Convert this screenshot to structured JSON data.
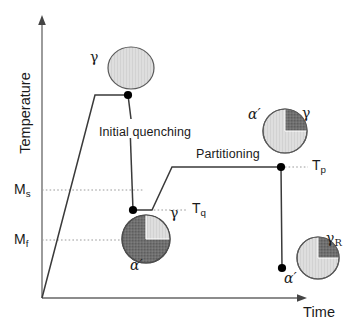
{
  "figure": {
    "type": "process-schematic"
  },
  "axes": {
    "y_label": "Temperature",
    "x_label": "Time",
    "y_arrow": "up-arrow-head",
    "x_arrow": "right-arrow-head",
    "origin": {
      "x": 42,
      "y": 298
    },
    "y_top": {
      "x": 42,
      "y": 18
    },
    "x_right": {
      "x": 306,
      "y": 298
    }
  },
  "temperature_markers": [
    {
      "id": "ms",
      "label_main": "M",
      "label_sub": "s",
      "y": 190,
      "dash_x_end": 143
    },
    {
      "id": "mf",
      "label_main": "M",
      "label_sub": "f",
      "y": 240,
      "dash_x_end": 122
    },
    {
      "id": "tq",
      "label_main": "T",
      "label_sub": "q",
      "y": 210,
      "dash_x_start": 152,
      "dash_x_end": 186
    },
    {
      "id": "tp",
      "label_main": "T",
      "label_sub": "p",
      "y": 167,
      "dash_x_start": 281,
      "dash_x_end": 306
    }
  ],
  "process_labels": [
    {
      "id": "initial-quenching",
      "text": "Initial quenching",
      "x": 100,
      "y": 127
    },
    {
      "id": "partitioning",
      "text": "Partitioning",
      "x": 196,
      "y": 149
    }
  ],
  "path_points": [
    {
      "x": 42,
      "y": 298
    },
    {
      "x": 95,
      "y": 95
    },
    {
      "x": 128,
      "y": 95
    },
    {
      "x": 133,
      "y": 210
    },
    {
      "x": 152,
      "y": 210
    },
    {
      "x": 172,
      "y": 167
    },
    {
      "x": 281,
      "y": 167
    },
    {
      "x": 282,
      "y": 268
    }
  ],
  "markers": [
    {
      "id": "austenitizing-end",
      "x": 128,
      "y": 95
    },
    {
      "id": "quench-stop",
      "x": 133,
      "y": 210
    },
    {
      "id": "partitioning-end",
      "x": 281,
      "y": 167
    },
    {
      "id": "final-quench-end",
      "x": 282,
      "y": 268
    }
  ],
  "microstructures": [
    {
      "id": "austenite",
      "cx": 131,
      "cy": 68,
      "rx": 23,
      "ry": 21,
      "base_fill": "light",
      "wedge": null,
      "labels": [
        {
          "id": "gamma",
          "text": "γ",
          "sub": "",
          "x": 92,
          "y": 52
        }
      ]
    },
    {
      "id": "as-quenched",
      "cx": 146,
      "cy": 239,
      "rx": 24,
      "ry": 24,
      "base_fill": "dark",
      "wedge": {
        "quadrant": "upper-right",
        "fill": "light"
      },
      "labels": [
        {
          "id": "gamma",
          "text": "γ",
          "sub": "",
          "x": 171,
          "y": 213
        },
        {
          "id": "alpha-prime",
          "text": "α′",
          "sub": "",
          "x": 133,
          "y": 263
        }
      ]
    },
    {
      "id": "partitioned",
      "cx": 285,
      "cy": 131,
      "rx": 22,
      "ry": 22,
      "base_fill": "light",
      "wedge": {
        "quadrant": "upper-right",
        "fill": "dark"
      },
      "labels": [
        {
          "id": "alpha-prime",
          "text": "α′",
          "sub": "",
          "x": 251,
          "y": 113
        },
        {
          "id": "gamma",
          "text": "γ",
          "sub": "",
          "x": 303,
          "y": 113
        }
      ]
    },
    {
      "id": "final",
      "cx": 318,
      "cy": 258,
      "rx": 21,
      "ry": 21,
      "base_fill": "light",
      "wedge": {
        "quadrant": "upper-right",
        "fill": "dark"
      },
      "labels": [
        {
          "id": "gamma-retained",
          "text": "γ",
          "sub": "R",
          "x": 330,
          "y": 237
        },
        {
          "id": "alpha-prime",
          "text": "α′",
          "sub": "",
          "x": 287,
          "y": 277
        }
      ]
    }
  ],
  "colors": {
    "line": "#3a3a3a",
    "axis": "#555555",
    "dotted": "#999999",
    "fill_light": "#dcdcdc",
    "fill_dark": "#6c6c6c",
    "outline": "#555555",
    "text": "#1a1a1a",
    "marker": "#000000"
  }
}
